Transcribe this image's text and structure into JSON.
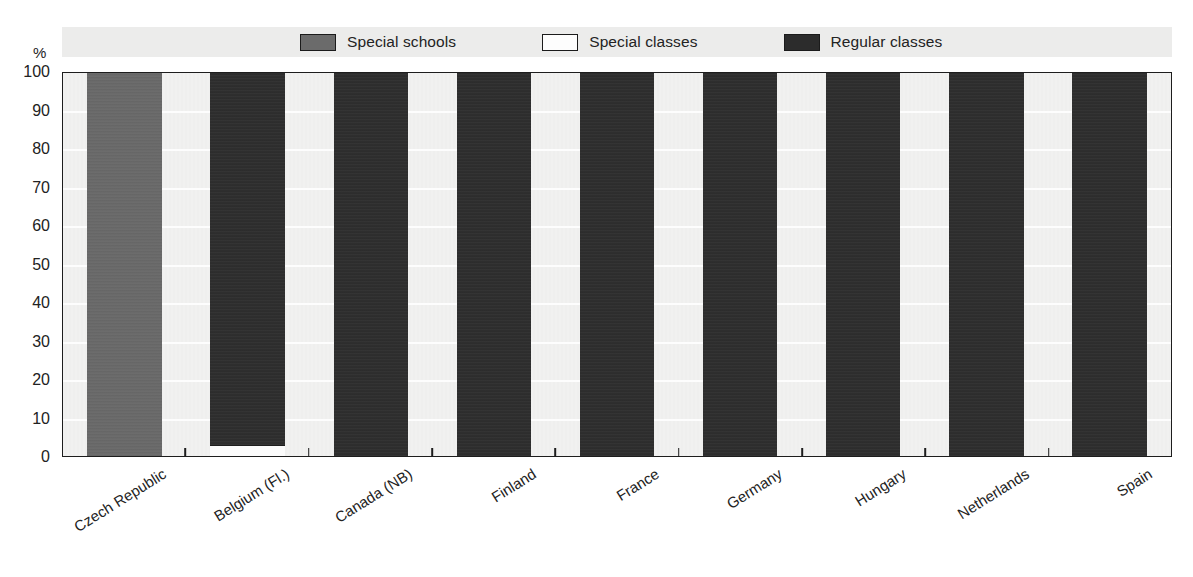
{
  "chart_data": {
    "type": "bar",
    "subtype": "stacked-100-percent",
    "title": "",
    "xlabel": "",
    "ylabel": "%",
    "ylim": [
      0,
      100
    ],
    "yticks": [
      0,
      10,
      20,
      30,
      40,
      50,
      60,
      70,
      80,
      90,
      100
    ],
    "grid": true,
    "legend_position": "top",
    "categories": [
      "Czech Republic",
      "Belgium (Fl.)",
      "Canada (NB)",
      "Finland",
      "France",
      "Germany",
      "Hungary",
      "Netherlands",
      "Spain"
    ],
    "series": [
      {
        "name": "Special schools",
        "color": "#696969",
        "values": [
          100,
          0,
          0,
          0,
          0,
          0,
          0,
          0,
          0
        ]
      },
      {
        "name": "Special classes",
        "color": "#fbfbfb",
        "values": [
          0,
          3,
          0,
          0,
          0,
          0,
          0,
          0,
          0
        ]
      },
      {
        "name": "Regular classes",
        "color": "#2c2c2c",
        "values": [
          0,
          97,
          100,
          100,
          100,
          100,
          100,
          100,
          100
        ]
      }
    ]
  },
  "axis": {
    "unit_label": "%",
    "y_tick_labels": [
      "100",
      "90",
      "80",
      "70",
      "60",
      "50",
      "40",
      "30",
      "20",
      "10",
      "0"
    ]
  },
  "legend": {
    "items": [
      {
        "label": "Special schools",
        "swatch": "sw-special-schools"
      },
      {
        "label": "Special classes",
        "swatch": "sw-special-classes"
      },
      {
        "label": "Regular classes",
        "swatch": "sw-regular-classes"
      }
    ]
  }
}
